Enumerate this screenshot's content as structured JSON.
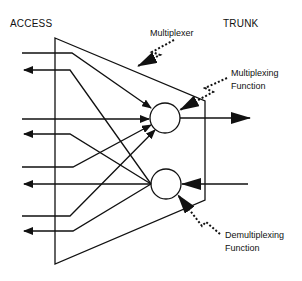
{
  "diagram": {
    "headers": {
      "left": "ACCESS",
      "right": "TRUNK"
    },
    "callouts": {
      "multiplexer": "Multiplexer",
      "multiplexing_line1": "Multiplexing",
      "multiplexing_line2": "Function",
      "demultiplexing_line1": "Demultiplexing",
      "demultiplexing_line2": "Function"
    },
    "colors": {
      "stroke": "#111111",
      "background": "#ffffff"
    }
  }
}
